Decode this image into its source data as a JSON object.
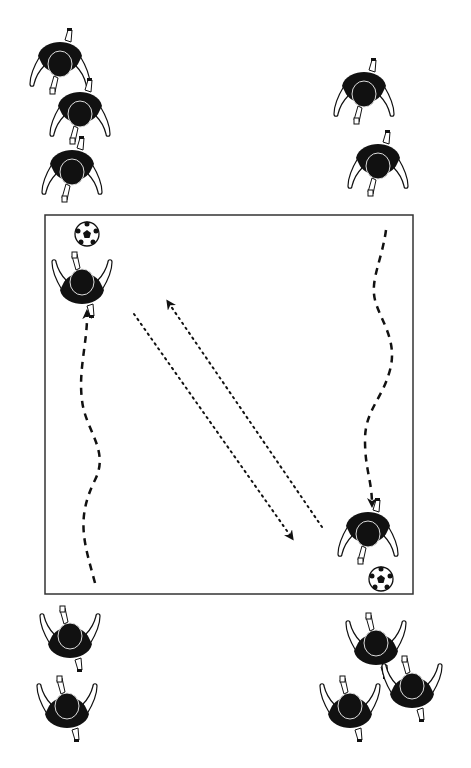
{
  "diagram": {
    "type": "soccer-drill",
    "background": "#ffffff",
    "ink": "#111111",
    "field": {
      "x": 45,
      "y": 215,
      "width": 368,
      "height": 379,
      "stroke": "#333333"
    },
    "player_groups": [
      {
        "name": "top-left",
        "players": [
          {
            "x": 60,
            "y": 70,
            "facing": "down"
          },
          {
            "x": 80,
            "y": 120,
            "facing": "down"
          },
          {
            "x": 72,
            "y": 178,
            "facing": "down"
          }
        ]
      },
      {
        "name": "top-right",
        "players": [
          {
            "x": 364,
            "y": 100,
            "facing": "down"
          },
          {
            "x": 378,
            "y": 172,
            "facing": "down"
          }
        ]
      },
      {
        "name": "bottom-left",
        "players": [
          {
            "x": 70,
            "y": 630,
            "facing": "up"
          },
          {
            "x": 67,
            "y": 700,
            "facing": "up"
          }
        ]
      },
      {
        "name": "bottom-right",
        "players": [
          {
            "x": 376,
            "y": 637,
            "facing": "up"
          },
          {
            "x": 412,
            "y": 680,
            "facing": "up"
          },
          {
            "x": 350,
            "y": 700,
            "facing": "up"
          }
        ]
      }
    ],
    "active_players": [
      {
        "name": "receiver-top-left",
        "x": 82,
        "y": 276,
        "facing": "up"
      },
      {
        "name": "receiver-bottom-right",
        "x": 368,
        "y": 540,
        "facing": "down"
      }
    ],
    "balls": [
      {
        "x": 87,
        "y": 234,
        "r": 12
      },
      {
        "x": 381,
        "y": 579,
        "r": 12
      }
    ],
    "dribble_paths": [
      {
        "name": "left-dribble",
        "d": "M95,583 C85,545 75,520 95,480 C110,450 85,430 82,400 C78,370 88,340 87,312"
      },
      {
        "name": "right-dribble",
        "d": "M386,230 C382,260 370,280 375,300 C380,320 398,340 390,370 C382,400 365,410 365,440 C365,470 372,480 372,505"
      }
    ],
    "pass_paths": [
      {
        "name": "pass-down",
        "x1": 134,
        "y1": 314,
        "x2": 292,
        "y2": 538
      },
      {
        "name": "pass-up",
        "x1": 322,
        "y1": 527,
        "x2": 168,
        "y2": 302
      }
    ]
  }
}
